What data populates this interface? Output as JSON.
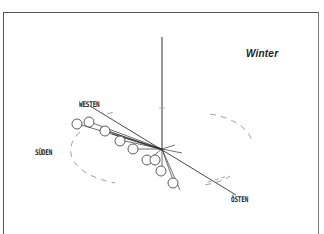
{
  "diagram": {
    "title": "Winter",
    "directions": {
      "west": "WESTEN",
      "south": "SÜDEN",
      "east": "ÖSTEN"
    },
    "elements": {
      "pole": "vertical gnomon / pole",
      "horizon": "dashed elliptical horizon",
      "sun_positions": 9,
      "axis": "west-east line"
    },
    "colors": {
      "ink": "#222222",
      "frame": "#555555",
      "dashed": "#888888",
      "background": "#ffffff"
    }
  }
}
